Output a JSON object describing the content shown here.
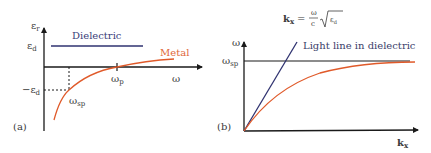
{
  "colors": {
    "axis": "#1a1a1a",
    "dielectric": "#2f3270",
    "metal": "#e05a2a",
    "text": "#3a3a3a"
  },
  "panel_a": {
    "label": "(a)",
    "y_axis_label": "ε",
    "y_axis_sub": "r",
    "x_axis_label": "ω",
    "eps_d_label": "ε",
    "eps_d_sub": "d",
    "neg_eps_d_label": "−ε",
    "neg_eps_d_sub": "d",
    "omega_p_label": "ω",
    "omega_p_sub": "p",
    "omega_sp_label": "ω",
    "omega_sp_sub": "sp",
    "dielectric_label": "Dielectric",
    "metal_label": "Metal"
  },
  "panel_b": {
    "label": "(b)",
    "y_axis_label": "ω",
    "x_axis_label": "k",
    "x_axis_sub": "x",
    "omega_sp_label": "ω",
    "omega_sp_sub": "sp",
    "light_line_label": "Light line in dielectric",
    "formula": {
      "lhs": "k",
      "lhs_sub": "x",
      "eq": "=",
      "num": "ω",
      "den": "c",
      "radicand": "ε",
      "radicand_sub": "d"
    }
  }
}
